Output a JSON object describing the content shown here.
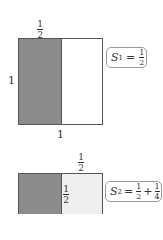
{
  "diagram1": {
    "top_label": {
      "num": "1",
      "den": "2"
    },
    "left_label": "1",
    "bottom_label": "1",
    "sum_label": {
      "var": "S",
      "sub": "1",
      "eq": "=",
      "terms": [
        {
          "num": "1",
          "den": "2"
        }
      ]
    },
    "colors": {
      "shaded": "#8c8c8c",
      "unshaded": "#ffffff"
    }
  },
  "diagram2": {
    "top_label": {
      "num": "1",
      "den": "2"
    },
    "inner_label": {
      "num": "1",
      "den": "2"
    },
    "sum_label": {
      "var": "S",
      "sub": "2",
      "eq": "=",
      "plus": "+",
      "terms": [
        {
          "num": "1",
          "den": "2"
        },
        {
          "num": "1",
          "den": "4"
        }
      ]
    },
    "colors": {
      "shaded": "#8c8c8c",
      "light": "#efefef"
    }
  }
}
